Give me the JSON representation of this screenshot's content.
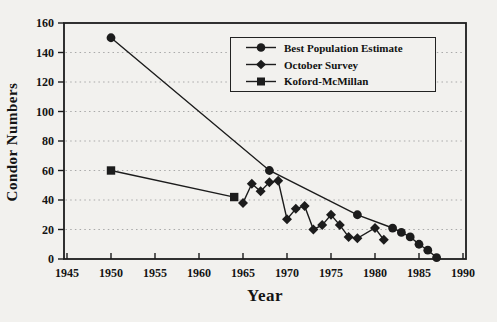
{
  "page": {
    "background": "#f2f1ee",
    "ink_color": "#1c1c1c",
    "grid_color": "#a9a9a9"
  },
  "chart_data": {
    "type": "line",
    "title": "",
    "xlabel": "Year",
    "ylabel": "Condor Numbers",
    "xlim": [
      1945,
      1990
    ],
    "ylim": [
      0,
      160
    ],
    "x_ticks": [
      1945,
      1950,
      1955,
      1960,
      1965,
      1970,
      1975,
      1980,
      1985,
      1990
    ],
    "y_ticks": [
      0,
      20,
      40,
      60,
      80,
      100,
      120,
      140,
      160
    ],
    "grid": "horizontal dotted gridlines at y-ticks, no vertical gridlines",
    "legend_position": "inside upper right, boxed",
    "series": [
      {
        "name": "Best Population Estimate",
        "marker": "circle",
        "icon": "circle-marker-icon",
        "color": "#1c1c1c",
        "points": [
          [
            1950,
            150
          ],
          [
            1968,
            60
          ],
          [
            1978,
            30
          ],
          [
            1982,
            21
          ],
          [
            1983,
            18
          ],
          [
            1984,
            15
          ],
          [
            1985,
            10
          ],
          [
            1986,
            6
          ],
          [
            1987,
            1
          ]
        ]
      },
      {
        "name": "October Survey",
        "marker": "diamond",
        "icon": "diamond-marker-icon",
        "color": "#1c1c1c",
        "points": [
          [
            1965,
            38
          ],
          [
            1966,
            51
          ],
          [
            1967,
            46
          ],
          [
            1968,
            52
          ],
          [
            1969,
            53
          ],
          [
            1970,
            27
          ],
          [
            1971,
            34
          ],
          [
            1972,
            36
          ],
          [
            1973,
            20
          ],
          [
            1974,
            23
          ],
          [
            1975,
            30
          ],
          [
            1976,
            23
          ],
          [
            1977,
            15
          ],
          [
            1978,
            14
          ],
          [
            1980,
            21
          ],
          [
            1981,
            13
          ]
        ]
      },
      {
        "name": "Koford-McMillan",
        "marker": "square",
        "icon": "square-marker-icon",
        "color": "#1c1c1c",
        "points": [
          [
            1950,
            60
          ],
          [
            1964,
            42
          ]
        ]
      }
    ]
  }
}
